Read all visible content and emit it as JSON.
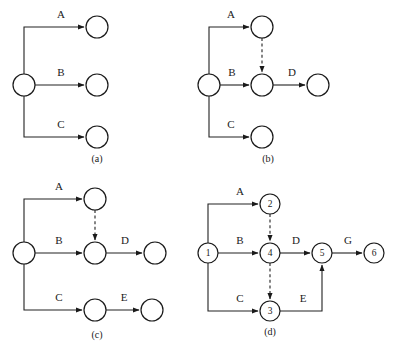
{
  "figure": {
    "background_color": "#ffffff",
    "stroke_color": "#1a1a1a",
    "width": 404,
    "height": 351,
    "arrow_marker": "solid-triangle-arrowhead"
  },
  "panels": [
    {
      "id": "a",
      "caption": "(a)",
      "caption_x": 97,
      "caption_y": 160,
      "nodes": [
        {
          "name": "start",
          "label": "",
          "cx": 24,
          "cy": 85,
          "r": 11
        },
        {
          "name": "a-target",
          "label": "",
          "cx": 97,
          "cy": 27,
          "r": 11
        },
        {
          "name": "b-target",
          "label": "",
          "cx": 97,
          "cy": 85,
          "r": 11
        },
        {
          "name": "c-target",
          "label": "",
          "cx": 97,
          "cy": 137,
          "r": 11
        }
      ],
      "edges": [
        {
          "name": "edge-a",
          "label": "A",
          "label_x": 61,
          "label_y": 15,
          "style": "solid",
          "path": "M 24,74 L 24,27 L 84,27"
        },
        {
          "name": "edge-b",
          "label": "B",
          "label_x": 61,
          "label_y": 73,
          "style": "solid",
          "path": "M 35,85 L 84,85"
        },
        {
          "name": "edge-c",
          "label": "C",
          "label_x": 61,
          "label_y": 125,
          "style": "solid",
          "path": "M 24,96 L 24,137 L 84,137"
        }
      ]
    },
    {
      "id": "b",
      "caption": "(b)",
      "caption_x": 268,
      "caption_y": 160,
      "nodes": [
        {
          "name": "start",
          "label": "",
          "cx": 209,
          "cy": 85,
          "r": 11
        },
        {
          "name": "a-target",
          "label": "",
          "cx": 262,
          "cy": 27,
          "r": 11
        },
        {
          "name": "b-target",
          "label": "",
          "cx": 262,
          "cy": 85,
          "r": 11
        },
        {
          "name": "d-target",
          "label": "",
          "cx": 318,
          "cy": 85,
          "r": 11
        },
        {
          "name": "c-target",
          "label": "",
          "cx": 262,
          "cy": 137,
          "r": 11
        }
      ],
      "edges": [
        {
          "name": "edge-a",
          "label": "A",
          "label_x": 231,
          "label_y": 15,
          "style": "solid",
          "path": "M 209,74 L 209,27 L 249,27"
        },
        {
          "name": "edge-b",
          "label": "B",
          "label_x": 232,
          "label_y": 73,
          "style": "solid",
          "path": "M 220,85 L 249,85"
        },
        {
          "name": "edge-dummy",
          "label": "",
          "label_x": 0,
          "label_y": 0,
          "style": "dashed",
          "path": "M 262,38 L 262,72"
        },
        {
          "name": "edge-d",
          "label": "D",
          "label_x": 292,
          "label_y": 73,
          "style": "solid",
          "path": "M 273,85 L 305,85"
        },
        {
          "name": "edge-c",
          "label": "C",
          "label_x": 231,
          "label_y": 125,
          "style": "solid",
          "path": "M 209,96 L 209,137 L 249,137"
        }
      ]
    },
    {
      "id": "c",
      "caption": "(c)",
      "caption_x": 97,
      "caption_y": 336,
      "nodes": [
        {
          "name": "start",
          "label": "",
          "cx": 24,
          "cy": 253,
          "r": 11
        },
        {
          "name": "a-target",
          "label": "",
          "cx": 95,
          "cy": 199,
          "r": 11
        },
        {
          "name": "b-target",
          "label": "",
          "cx": 95,
          "cy": 253,
          "r": 11
        },
        {
          "name": "d-target",
          "label": "",
          "cx": 155,
          "cy": 253,
          "r": 11
        },
        {
          "name": "c-target",
          "label": "",
          "cx": 95,
          "cy": 310,
          "r": 11
        },
        {
          "name": "e-target",
          "label": "",
          "cx": 152,
          "cy": 310,
          "r": 11
        }
      ],
      "edges": [
        {
          "name": "edge-a",
          "label": "A",
          "label_x": 59,
          "label_y": 187,
          "style": "solid",
          "path": "M 24,242 L 24,199 L 82,199"
        },
        {
          "name": "edge-b",
          "label": "B",
          "label_x": 59,
          "label_y": 241,
          "style": "solid",
          "path": "M 35,253 L 82,253"
        },
        {
          "name": "edge-dummy",
          "label": "",
          "label_x": 0,
          "label_y": 0,
          "style": "dashed",
          "path": "M 95,210 L 95,240"
        },
        {
          "name": "edge-d",
          "label": "D",
          "label_x": 125,
          "label_y": 241,
          "style": "solid",
          "path": "M 106,253 L 142,253"
        },
        {
          "name": "edge-c",
          "label": "C",
          "label_x": 59,
          "label_y": 298,
          "style": "solid",
          "path": "M 24,264 L 24,310 L 82,310"
        },
        {
          "name": "edge-e",
          "label": "E",
          "label_x": 124,
          "label_y": 298,
          "style": "solid",
          "path": "M 106,310 L 139,310"
        }
      ]
    },
    {
      "id": "d",
      "caption": "(d)",
      "caption_x": 270,
      "caption_y": 333,
      "nodes": [
        {
          "name": "node-1",
          "label": "1",
          "cx": 208,
          "cy": 253,
          "r": 10
        },
        {
          "name": "node-2",
          "label": "2",
          "cx": 270,
          "cy": 204,
          "r": 10
        },
        {
          "name": "node-3",
          "label": "3",
          "cx": 270,
          "cy": 311,
          "r": 10
        },
        {
          "name": "node-4",
          "label": "4",
          "cx": 270,
          "cy": 253,
          "r": 10
        },
        {
          "name": "node-5",
          "label": "5",
          "cx": 322,
          "cy": 253,
          "r": 10
        },
        {
          "name": "node-6",
          "label": "6",
          "cx": 374,
          "cy": 253,
          "r": 10
        }
      ],
      "edges": [
        {
          "name": "edge-a",
          "label": "A",
          "label_x": 240,
          "label_y": 192,
          "style": "solid",
          "path": "M 208,243 L 208,204 L 258,204"
        },
        {
          "name": "edge-b",
          "label": "B",
          "label_x": 240,
          "label_y": 241,
          "style": "solid",
          "path": "M 218,253 L 258,253"
        },
        {
          "name": "edge-dummy-2-4",
          "label": "",
          "label_x": 0,
          "label_y": 0,
          "style": "dashed",
          "path": "M 270,214 L 270,241"
        },
        {
          "name": "edge-dummy-4-3",
          "label": "",
          "label_x": 0,
          "label_y": 0,
          "style": "dashed",
          "path": "M 270,263 L 270,299"
        },
        {
          "name": "edge-c",
          "label": "C",
          "label_x": 240,
          "label_y": 299,
          "style": "solid",
          "path": "M 208,263 L 208,311 L 258,311"
        },
        {
          "name": "edge-d",
          "label": "D",
          "label_x": 296,
          "label_y": 241,
          "style": "solid",
          "path": "M 280,253 L 310,253"
        },
        {
          "name": "edge-e",
          "label": "E",
          "label_x": 303,
          "label_y": 299,
          "style": "solid",
          "path": "M 280,311 L 322,311 L 322,265"
        },
        {
          "name": "edge-g",
          "label": "G",
          "label_x": 348,
          "label_y": 241,
          "style": "solid",
          "path": "M 332,253 L 362,253"
        }
      ]
    }
  ]
}
